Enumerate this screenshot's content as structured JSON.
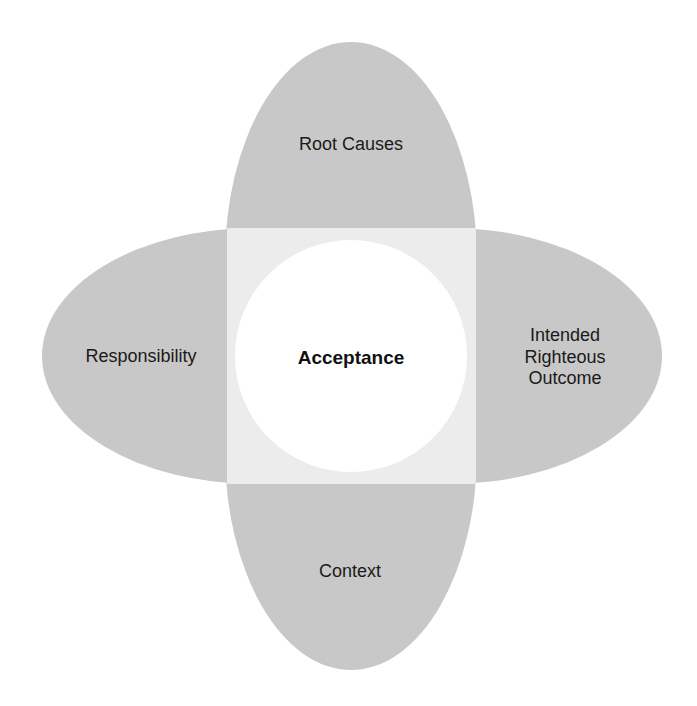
{
  "diagram": {
    "center": {
      "label": "Acceptance"
    },
    "petals": [
      {
        "position": "top",
        "label": "Root Causes"
      },
      {
        "position": "left",
        "label": "Responsibility"
      },
      {
        "position": "right",
        "label_lines": [
          "Intended",
          "Righteous",
          "Outcome"
        ]
      },
      {
        "position": "bottom",
        "label": "Context"
      }
    ],
    "colors": {
      "petal_fill": "#c8c8c8",
      "overlap_fill": "#ececec",
      "center_fill": "#ffffff",
      "text": "#1a1a1a"
    }
  }
}
